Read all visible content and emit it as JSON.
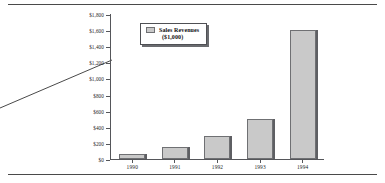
{
  "chart_data": {
    "type": "bar",
    "title": "",
    "xlabel": "",
    "ylabel": "",
    "categories": [
      "1990",
      "1991",
      "1992",
      "1993",
      "1994"
    ],
    "values": [
      65,
      155,
      280,
      495,
      1600
    ],
    "series": [
      {
        "name": "Sales Revenues ($1,000)",
        "values": [
          65,
          155,
          280,
          495,
          1600
        ]
      }
    ],
    "ylim": [
      0,
      1800
    ],
    "ytick_step": 200,
    "ytick_labels": [
      "$0",
      "$200",
      "$400",
      "$600",
      "$800",
      "$1,000",
      "$1,200",
      "$1,400",
      "$1,600",
      "$1,800"
    ],
    "ytick_values": [
      0,
      200,
      400,
      600,
      800,
      1000,
      1200,
      1400,
      1600,
      1800
    ],
    "grid": false,
    "legend_position": "top-left-inside",
    "bar_color": "#c9c9c9",
    "bar_edge_color": "#6f7073",
    "axis_color": "#55565a"
  },
  "legend": {
    "label": "Sales Revenues",
    "units": "($1,000)"
  }
}
